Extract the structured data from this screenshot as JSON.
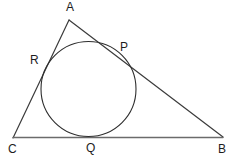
{
  "figure": {
    "canvas": {
      "width": 231,
      "height": 158,
      "background": "#ffffff"
    },
    "stroke_color": "#3b3b3b",
    "stroke_color_base": "#6b6b6b",
    "circle_stroke_color": "#2e2e2e",
    "label_color": "#1d1d1d",
    "stroke_width": 1.1
  },
  "triangle": {
    "name": "ABC",
    "vertices": [
      {
        "id": "A",
        "label": "A",
        "x": 69,
        "y": 20,
        "label_x": 66,
        "label_y": 1
      },
      {
        "id": "B",
        "label": "B",
        "x": 223,
        "y": 137,
        "label_x": 218,
        "label_y": 143
      },
      {
        "id": "C",
        "label": "C",
        "x": 13,
        "y": 138,
        "label_x": 8,
        "label_y": 143
      }
    ],
    "sides": [
      {
        "id": "AB",
        "from": "A",
        "to": "B"
      },
      {
        "id": "CB",
        "from": "C",
        "to": "B"
      },
      {
        "id": "CA",
        "from": "C",
        "to": "A"
      }
    ]
  },
  "incircle": {
    "center_x": 88.5,
    "center_y": 89,
    "radius": 47.5
  },
  "tangency_points": [
    {
      "id": "P",
      "label": "P",
      "on_side": "AB",
      "x": 119,
      "y": 56,
      "label_x": 120,
      "label_y": 41
    },
    {
      "id": "Q",
      "label": "Q",
      "on_side": "CB",
      "x": 90,
      "y": 136.5,
      "label_x": 86,
      "label_y": 142
    },
    {
      "id": "R",
      "label": "R",
      "on_side": "CA",
      "x": 44,
      "y": 66,
      "label_x": 30,
      "label_y": 54
    }
  ]
}
